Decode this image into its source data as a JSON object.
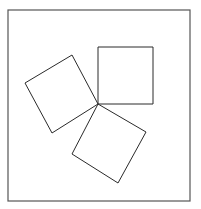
{
  "diagram": {
    "colors": {
      "line": "#2a2a2a",
      "frame": "#555555",
      "background": "#ffffff"
    },
    "frame": {
      "x": 8,
      "y": 10,
      "width": 182,
      "height": 191
    },
    "shared_vertex": [
      98,
      104
    ],
    "squares": [
      {
        "name": "upper-right-square",
        "points": "98,47 153,47 153,104 98,104"
      },
      {
        "name": "left-square",
        "points": "72,55 25,83 52,133 98,104"
      },
      {
        "name": "lower-square",
        "points": "98,104 146,132 118,183 72,154"
      }
    ]
  }
}
